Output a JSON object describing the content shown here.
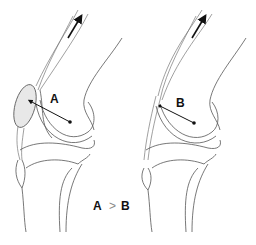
{
  "diagram": {
    "panels": [
      {
        "id": "left",
        "label": "A",
        "patella": "enlarged / displaced anteriorly",
        "moment_arm": "A",
        "force_arrow": "quadriceps pull, proximal direction"
      },
      {
        "id": "right",
        "label": "B",
        "patella": "absent / thin",
        "moment_arm": "B",
        "force_arrow": "quadriceps pull, proximal direction"
      }
    ],
    "comparison": {
      "left": "A",
      "operator": ">",
      "right": "B"
    },
    "colors": {
      "lines": "#555555",
      "text": "#111111",
      "patella_fill": "#e8e8e8"
    }
  }
}
